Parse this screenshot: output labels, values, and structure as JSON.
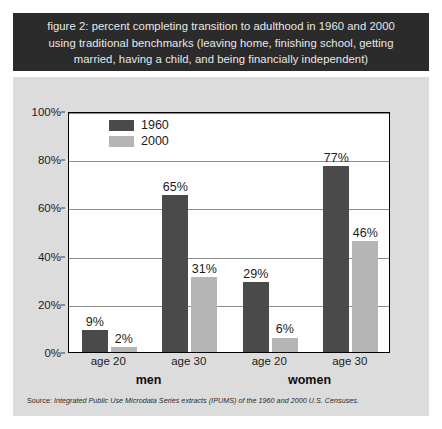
{
  "figure": {
    "title": "figure 2: percent completing transition to adulthood in 1960 and 2000\nusing traditional benchmarks (leaving home, finishing school, getting\nmarried, having a child, and being financially independent)",
    "source_label": "Source:",
    "source_text": " Integrated Public Use Microdata Series extracts (IPUMS) of the 1960 and 2000 U.S. Censuses.",
    "colors": {
      "banner_background": "#2b2b2b",
      "banner_text": "#e8e8e8",
      "panel_background": "#dcdcdc",
      "plot_background": "#ffffff",
      "series_1960": "#4a4a4a",
      "series_2000": "#b5b5b5",
      "gridline": "#8d8d8d",
      "axis": "#000000"
    }
  },
  "chart_data": {
    "type": "bar",
    "title": "figure 2: percent completing transition to adulthood in 1960 and 2000 using traditional benchmarks (leaving home, finishing school, getting married, having a child, and being financially independent)",
    "xlabel": "",
    "ylabel": "",
    "ylim": [
      0,
      100
    ],
    "yticks": [
      0,
      20,
      40,
      60,
      80,
      100
    ],
    "ytick_labels": [
      "0%",
      "20%",
      "40%",
      "60%",
      "80%",
      "100%"
    ],
    "grid": true,
    "legend_position": "top-left-inside",
    "categories": [
      "age 20",
      "age 30",
      "age 20",
      "age 30"
    ],
    "groups": [
      {
        "label": "men",
        "categories": [
          "age 20",
          "age 30"
        ]
      },
      {
        "label": "women",
        "categories": [
          "age 20",
          "age 30"
        ]
      }
    ],
    "series": [
      {
        "name": "1960",
        "color": "#4a4a4a",
        "values": [
          9,
          65,
          29,
          77
        ],
        "data_labels": [
          "9%",
          "65%",
          "29%",
          "77%"
        ]
      },
      {
        "name": "2000",
        "color": "#b5b5b5",
        "values": [
          2,
          31,
          6,
          46
        ],
        "data_labels": [
          "2%",
          "31%",
          "6%",
          "46%"
        ]
      }
    ]
  }
}
